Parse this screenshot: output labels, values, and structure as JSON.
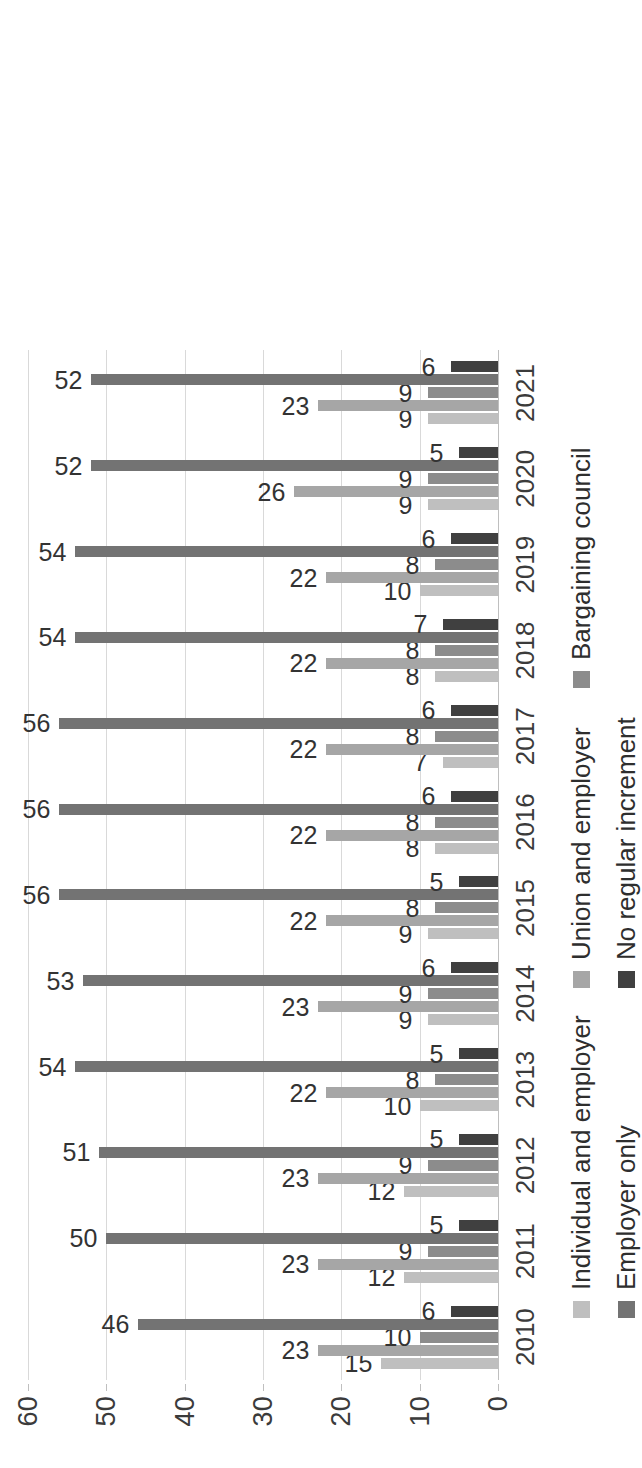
{
  "chart_data": {
    "type": "bar",
    "orientation": "vertical",
    "title": "",
    "subtitle": "",
    "xlabel": "",
    "ylabel": "",
    "ylim": [
      0,
      60
    ],
    "yticks": [
      "0",
      "10",
      "20",
      "30",
      "40",
      "50",
      "60"
    ],
    "grid": true,
    "legend_position": "bottom",
    "categories": [
      "2010",
      "2011",
      "2012",
      "2013",
      "2014",
      "2015",
      "2016",
      "2017",
      "2018",
      "2019",
      "2020",
      "2021"
    ],
    "series": [
      {
        "name": "Individual and employer",
        "color": "#bfbfbf",
        "values": [
          15,
          12,
          12,
          10,
          9,
          9,
          8,
          7,
          8,
          10,
          9,
          9
        ]
      },
      {
        "name": "Union and employer",
        "color": "#a6a6a6",
        "values": [
          23,
          23,
          23,
          22,
          23,
          22,
          22,
          22,
          22,
          22,
          26,
          23
        ]
      },
      {
        "name": "Bargaining council",
        "color": "#8c8c8c",
        "values": [
          10,
          9,
          9,
          8,
          9,
          8,
          8,
          8,
          8,
          8,
          9,
          9
        ]
      },
      {
        "name": "Employer only",
        "color": "#737373",
        "values": [
          46,
          50,
          51,
          54,
          53,
          56,
          56,
          56,
          54,
          54,
          52,
          52
        ]
      },
      {
        "name": "No regular increment",
        "color": "#404040",
        "values": [
          6,
          5,
          5,
          5,
          6,
          5,
          6,
          6,
          7,
          6,
          5,
          6
        ]
      }
    ]
  },
  "legend": {
    "rows": [
      [
        {
          "label": "Individual and employer",
          "color": "#bfbfbf"
        },
        {
          "label": "Union and employer",
          "color": "#a6a6a6"
        },
        {
          "label": "Bargaining council",
          "color": "#8c8c8c"
        }
      ],
      [
        {
          "label": "Employer only",
          "color": "#737373"
        },
        {
          "label": "No regular increment",
          "color": "#404040"
        }
      ]
    ]
  },
  "axis": {
    "y_max": 60,
    "y_min": 0,
    "y_step": 10
  }
}
